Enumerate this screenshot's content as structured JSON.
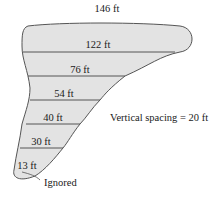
{
  "diagram": {
    "type": "cross-section widths (Simpson's rule)",
    "widths": [
      {
        "label": "146 ft",
        "value": 146
      },
      {
        "label": "122 ft",
        "value": 122
      },
      {
        "label": "76 ft",
        "value": 76
      },
      {
        "label": "54 ft",
        "value": 54
      },
      {
        "label": "40 ft",
        "value": 40
      },
      {
        "label": "30 ft",
        "value": 30
      },
      {
        "label": "13 ft",
        "value": 13
      }
    ],
    "spacing_label": "Vertical spacing = 20 ft",
    "ignored_label": "Ignored",
    "colors": {
      "fill": "#e3e3e3",
      "stroke": "#555555"
    }
  }
}
